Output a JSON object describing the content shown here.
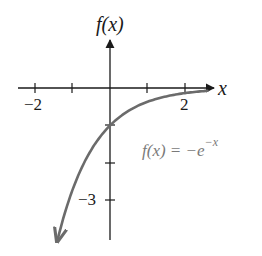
{
  "chart_data": {
    "type": "line",
    "title": "",
    "xlabel": "x",
    "ylabel": "f(x)",
    "function": "f(x) = -e^{-x}",
    "annotation": "f(x) = −e",
    "annotation_exponent": "−x",
    "x_ticks": [
      -2,
      -1,
      1,
      2
    ],
    "x_tick_labels": [
      "−2",
      "2"
    ],
    "y_ticks": [
      -1,
      -2,
      -3
    ],
    "y_tick_labels": [
      "−3"
    ],
    "xlim": [
      -2.5,
      2.8
    ],
    "ylim": [
      -4.1,
      2.3
    ],
    "grid": false,
    "legend": "none",
    "series": [
      {
        "name": "f(x) = -e^{-x}",
        "color": "#6b6b6b",
        "x": [
          -1.4,
          -1.2,
          -1.0,
          -0.8,
          -0.6,
          -0.4,
          -0.2,
          0,
          0.5,
          1.0,
          1.5,
          2.0,
          2.5
        ],
        "y": [
          -4.06,
          -3.32,
          -2.72,
          -2.23,
          -1.82,
          -1.49,
          -1.22,
          -1.0,
          -0.61,
          -0.37,
          -0.22,
          -0.14,
          -0.08
        ]
      }
    ]
  },
  "labels": {
    "x_axis": "x",
    "y_axis": "f(x)",
    "x_tick_neg2": "−2",
    "x_tick_2": "2",
    "y_tick_neg3": "−3",
    "func_main": "f(x) = −e",
    "func_exp": "−x"
  },
  "colors": {
    "axis": "#1a1a1a",
    "curve": "#6b6b6b",
    "annotation": "#7a7a7a"
  }
}
